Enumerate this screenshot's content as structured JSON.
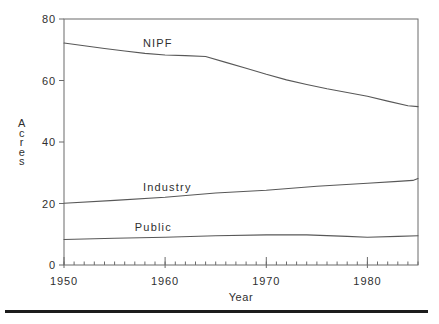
{
  "figure": {
    "bottom_rule_color": "#1c1c1c",
    "background_color": "#ffffff"
  },
  "chart_data": {
    "type": "line",
    "title": "",
    "xlabel": "Year",
    "ylabel": "Acres",
    "xlim": [
      1950,
      1985
    ],
    "ylim": [
      0,
      80
    ],
    "x_major_ticks": [
      1950,
      1960,
      1970,
      1980
    ],
    "x_minor_tick_step": 1,
    "y_ticks": [
      0,
      20,
      40,
      60,
      80
    ],
    "grid": false,
    "legend_position": "inline-labels",
    "colors": {
      "line": "#585858",
      "axis": "#6b6b6b",
      "text": "#2f2f2f"
    },
    "series": [
      {
        "name": "NIPF",
        "label": {
          "text": "NIPF",
          "x": 1957.8,
          "y": 70.9
        },
        "x": [
          1950,
          1952,
          1954,
          1956,
          1958,
          1960,
          1962,
          1964,
          1966,
          1968,
          1970,
          1972,
          1974,
          1976,
          1978,
          1980,
          1982,
          1984,
          1985
        ],
        "y": [
          72.2,
          71.3,
          70.4,
          69.6,
          68.8,
          68.3,
          68.1,
          67.8,
          65.9,
          64.0,
          62.0,
          60.2,
          58.7,
          57.3,
          56.1,
          54.9,
          53.3,
          51.8,
          51.5
        ]
      },
      {
        "name": "Industry",
        "label": {
          "text": "Industry",
          "x": 1957.8,
          "y": 24.1
        },
        "x": [
          1950,
          1955,
          1960,
          1965,
          1970,
          1975,
          1980,
          1983,
          1984.5,
          1985
        ],
        "y": [
          20.1,
          21.0,
          22.0,
          23.4,
          24.3,
          25.6,
          26.6,
          27.2,
          27.5,
          28.1
        ]
      },
      {
        "name": "Public",
        "label": {
          "text": "Public",
          "x": 1957.0,
          "y": 11.0
        },
        "x": [
          1950,
          1955,
          1960,
          1965,
          1970,
          1974,
          1978,
          1980,
          1983,
          1985
        ],
        "y": [
          8.3,
          8.7,
          9.0,
          9.5,
          9.8,
          9.8,
          9.3,
          9.0,
          9.3,
          9.5
        ]
      }
    ]
  }
}
